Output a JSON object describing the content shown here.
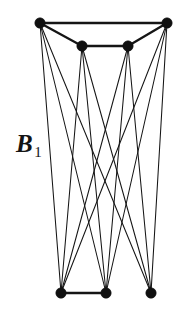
{
  "figure": {
    "label_base": "B",
    "label_subscript": "1",
    "label_full": "B1",
    "background_color": "#ffffff",
    "ink_color": "#151515",
    "vertex_color": "#101010"
  },
  "chart_data": {
    "type": "diagram",
    "diagram_kind": "graph",
    "title": "B1",
    "width": 184,
    "height": 325,
    "vertex_radius": 5.2,
    "nodes": [
      {
        "id": "t1",
        "label": "top-outer-left",
        "x": 40,
        "y": 23,
        "group": "top"
      },
      {
        "id": "t2",
        "label": "top-inner-left",
        "x": 82,
        "y": 46,
        "group": "top"
      },
      {
        "id": "t3",
        "label": "top-inner-right",
        "x": 128,
        "y": 46,
        "group": "top"
      },
      {
        "id": "t4",
        "label": "top-outer-right",
        "x": 167,
        "y": 23,
        "group": "top"
      },
      {
        "id": "b1",
        "label": "bottom-left",
        "x": 61,
        "y": 293,
        "group": "bottom"
      },
      {
        "id": "b2",
        "label": "bottom-middle",
        "x": 106,
        "y": 293,
        "group": "bottom"
      },
      {
        "id": "b3",
        "label": "bottom-right",
        "x": 151,
        "y": 293,
        "group": "bottom"
      }
    ],
    "edges": [
      {
        "from": "t1",
        "to": "t4",
        "kind": "rail"
      },
      {
        "from": "t1",
        "to": "t2",
        "kind": "rail"
      },
      {
        "from": "t2",
        "to": "t3",
        "kind": "rail"
      },
      {
        "from": "t3",
        "to": "t4",
        "kind": "rail"
      },
      {
        "from": "b1",
        "to": "b2",
        "kind": "rail"
      },
      {
        "from": "t1",
        "to": "b1",
        "kind": "cross"
      },
      {
        "from": "t1",
        "to": "b2",
        "kind": "cross"
      },
      {
        "from": "t1",
        "to": "b3",
        "kind": "cross"
      },
      {
        "from": "t2",
        "to": "b1",
        "kind": "cross"
      },
      {
        "from": "t2",
        "to": "b2",
        "kind": "cross"
      },
      {
        "from": "t2",
        "to": "b3",
        "kind": "cross"
      },
      {
        "from": "t3",
        "to": "b1",
        "kind": "cross"
      },
      {
        "from": "t3",
        "to": "b2",
        "kind": "cross"
      },
      {
        "from": "t3",
        "to": "b3",
        "kind": "cross"
      },
      {
        "from": "t4",
        "to": "b1",
        "kind": "cross"
      },
      {
        "from": "t4",
        "to": "b2",
        "kind": "cross"
      },
      {
        "from": "t4",
        "to": "b3",
        "kind": "cross"
      }
    ],
    "counts": {
      "top_vertices": 4,
      "bottom_vertices": 3,
      "total_vertices": 7,
      "cross_edges": 12,
      "rail_edges": 5,
      "total_edges": 17
    }
  }
}
